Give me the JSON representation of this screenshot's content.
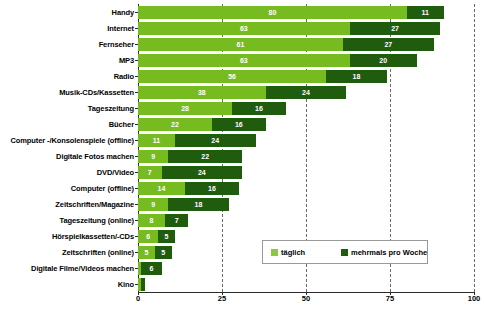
{
  "chart_data": {
    "type": "bar",
    "orientation": "horizontal",
    "stacked": true,
    "title": "",
    "subtitle": "",
    "xlabel": "",
    "ylabel": "",
    "xlim": [
      0,
      100
    ],
    "xticks": [
      0,
      25,
      50,
      75,
      100
    ],
    "grid": "vertical-dashed",
    "legend_position": "inside-bottom-right",
    "categories": [
      "Handy",
      "Internet",
      "Fernseher",
      "MP3",
      "Radio",
      "Musik-CDs/Kassetten",
      "Tageszeitung",
      "Bücher",
      "Computer -/Konsolenspiele (offline)",
      "Digitale Fotos machen",
      "DVD/Video",
      "Computer (offline)",
      "Zeitschriften/Magazine",
      "Tageszeitung (online)",
      "Hörspielkassetten/-CDs",
      "Zeitschriften (online)",
      "Digitale Filme/Videos machen",
      "Kino"
    ],
    "series": [
      {
        "name": "täglich",
        "color": "#76bc21",
        "values": [
          80,
          63,
          61,
          63,
          56,
          38,
          28,
          22,
          11,
          9,
          7,
          14,
          9,
          8,
          6,
          5,
          1,
          1
        ]
      },
      {
        "name": "mehrmals pro Woche",
        "color": "#1f5c0e",
        "values": [
          11,
          27,
          27,
          20,
          18,
          24,
          16,
          16,
          24,
          22,
          24,
          16,
          18,
          7,
          5,
          5,
          6,
          1
        ]
      }
    ],
    "labels": {
      "taeglich": [
        "80",
        "63",
        "61",
        "63",
        "56",
        "38",
        "28",
        "22",
        "11",
        "9",
        "7",
        "14",
        "9",
        "8",
        "6",
        "5",
        "",
        ""
      ],
      "mehrmals": [
        "11",
        "27",
        "27",
        "20",
        "18",
        "24",
        "16",
        "16",
        "24",
        "22",
        "24",
        "16",
        "18",
        "7",
        "5",
        "5",
        "6",
        ""
      ]
    }
  },
  "legend": {
    "items": [
      {
        "label": "täglich",
        "color": "#8dc63f"
      },
      {
        "label": "mehrmals pro Woche",
        "color": "#1f5c0e"
      }
    ]
  },
  "axis": {
    "x_tick_labels": [
      "0",
      "25",
      "50",
      "75",
      "100"
    ]
  }
}
